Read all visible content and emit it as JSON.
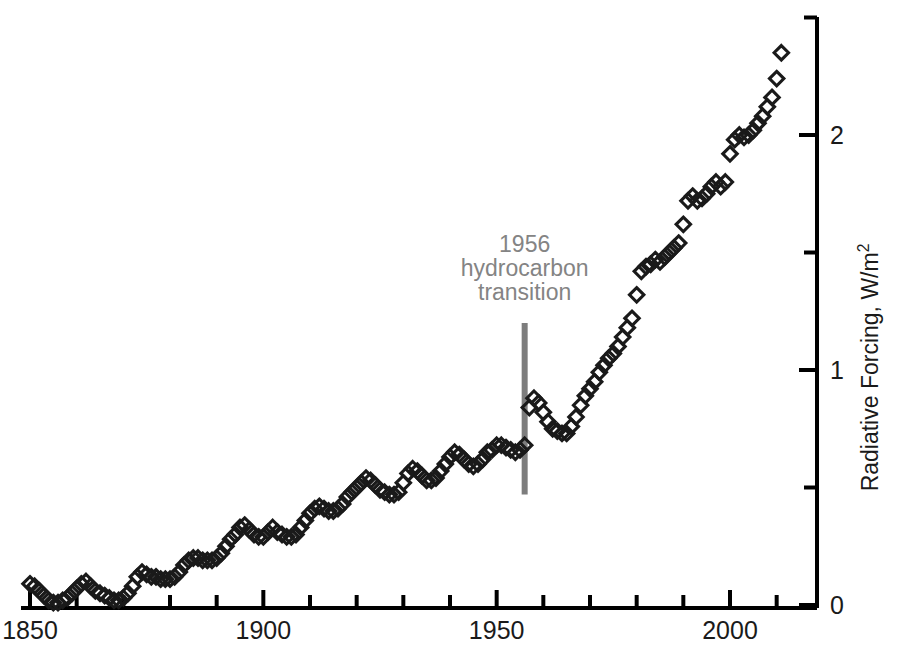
{
  "figure": {
    "background": "#ffffff",
    "marker_color": "#1a1a1a",
    "axis_color": "#000000",
    "annotation_color": "#848484"
  },
  "annotation": {
    "line1": "1956",
    "line2": "hydrocarbon",
    "line3": "transition",
    "marker_year": 1956,
    "marker_color": "#7d7d7d",
    "bar_top_value": 1.2,
    "bar_bottom_value": 0.47
  },
  "caption": {
    "text": ""
  },
  "chart_data": {
    "type": "scatter",
    "title": "",
    "xlabel": "",
    "ylabel": "Radiative Forcing, W/m",
    "ylabel_sup": "2",
    "xlim": [
      1848,
      2016
    ],
    "ylim": [
      0,
      2.58
    ],
    "grid": false,
    "legend": null,
    "xticks_major": [
      1850,
      1900,
      1950,
      2000
    ],
    "xticks_minor_step": 10,
    "xtick_labels": [
      "1850",
      "1900",
      "1950",
      "2000"
    ],
    "yticks_major": [
      0,
      1,
      2
    ],
    "yticks_minor": [
      0.5,
      1.5,
      2.5
    ],
    "ytick_labels": [
      "0",
      "1",
      "2"
    ],
    "marker": "open-diamond",
    "series": [
      {
        "name": "Radiative forcing",
        "x": [
          1850,
          1851,
          1852,
          1853,
          1854,
          1855,
          1856,
          1857,
          1858,
          1859,
          1860,
          1861,
          1862,
          1863,
          1864,
          1865,
          1866,
          1867,
          1868,
          1869,
          1870,
          1871,
          1872,
          1873,
          1874,
          1875,
          1876,
          1877,
          1878,
          1879,
          1880,
          1881,
          1882,
          1883,
          1884,
          1885,
          1886,
          1887,
          1888,
          1889,
          1890,
          1891,
          1892,
          1893,
          1894,
          1895,
          1896,
          1897,
          1898,
          1899,
          1900,
          1901,
          1902,
          1903,
          1904,
          1905,
          1906,
          1907,
          1908,
          1909,
          1910,
          1911,
          1912,
          1913,
          1914,
          1915,
          1916,
          1917,
          1918,
          1919,
          1920,
          1921,
          1922,
          1923,
          1924,
          1925,
          1926,
          1927,
          1928,
          1929,
          1930,
          1931,
          1932,
          1933,
          1934,
          1935,
          1936,
          1937,
          1938,
          1939,
          1940,
          1941,
          1942,
          1943,
          1944,
          1945,
          1946,
          1947,
          1948,
          1949,
          1950,
          1951,
          1952,
          1953,
          1954,
          1955,
          1956,
          1957,
          1958,
          1959,
          1960,
          1961,
          1962,
          1963,
          1964,
          1965,
          1966,
          1967,
          1968,
          1969,
          1970,
          1971,
          1972,
          1973,
          1974,
          1975,
          1976,
          1977,
          1978,
          1979,
          1980,
          1981,
          1982,
          1983,
          1984,
          1985,
          1986,
          1987,
          1988,
          1989,
          1990,
          1991,
          1992,
          1993,
          1994,
          1995,
          1996,
          1997,
          1998,
          1999,
          2000,
          2001,
          2002,
          2003,
          2004,
          2005,
          2006,
          2007,
          2008,
          2009,
          2010,
          2011
        ],
        "y": [
          0.09,
          0.08,
          0.06,
          0.04,
          0.02,
          0.01,
          0.01,
          0.02,
          0.03,
          0.05,
          0.07,
          0.09,
          0.1,
          0.08,
          0.06,
          0.05,
          0.04,
          0.03,
          0.02,
          0.02,
          0.03,
          0.05,
          0.08,
          0.12,
          0.14,
          0.13,
          0.12,
          0.12,
          0.11,
          0.11,
          0.11,
          0.12,
          0.14,
          0.17,
          0.19,
          0.2,
          0.2,
          0.19,
          0.19,
          0.19,
          0.2,
          0.22,
          0.25,
          0.28,
          0.3,
          0.33,
          0.34,
          0.32,
          0.3,
          0.29,
          0.29,
          0.31,
          0.33,
          0.31,
          0.3,
          0.29,
          0.29,
          0.3,
          0.33,
          0.36,
          0.39,
          0.41,
          0.42,
          0.41,
          0.4,
          0.4,
          0.41,
          0.43,
          0.46,
          0.48,
          0.5,
          0.52,
          0.54,
          0.53,
          0.51,
          0.49,
          0.48,
          0.47,
          0.47,
          0.48,
          0.52,
          0.56,
          0.58,
          0.57,
          0.55,
          0.53,
          0.53,
          0.54,
          0.57,
          0.6,
          0.63,
          0.65,
          0.64,
          0.62,
          0.6,
          0.59,
          0.6,
          0.62,
          0.65,
          0.66,
          0.68,
          0.68,
          0.67,
          0.66,
          0.65,
          0.66,
          0.68,
          0.84,
          0.88,
          0.86,
          0.82,
          0.78,
          0.75,
          0.74,
          0.73,
          0.73,
          0.76,
          0.8,
          0.85,
          0.89,
          0.92,
          0.95,
          0.99,
          1.02,
          1.05,
          1.07,
          1.1,
          1.14,
          1.18,
          1.22,
          1.32,
          1.42,
          1.44,
          1.45,
          1.47,
          1.46,
          1.48,
          1.5,
          1.52,
          1.54,
          1.62,
          1.72,
          1.74,
          1.72,
          1.73,
          1.75,
          1.78,
          1.8,
          1.78,
          1.8,
          1.92,
          1.98,
          2.0,
          1.99,
          2.0,
          2.02,
          2.05,
          2.08,
          2.12,
          2.16,
          2.24,
          2.35
        ]
      }
    ]
  }
}
